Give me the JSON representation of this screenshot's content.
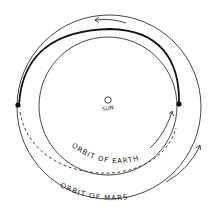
{
  "diagram": {
    "type": "orbital-transfer",
    "labels": {
      "sun": "SUN",
      "earth_orbit": "ORBIT OF EARTH",
      "mars_orbit": "ORBIT OF MARS"
    },
    "colors": {
      "ink": "#222222",
      "background": "#ffffff"
    }
  }
}
